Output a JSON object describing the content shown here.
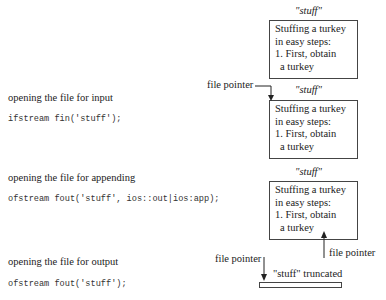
{
  "file_name": "\"stuff\"",
  "file_contents": [
    "Stuffing a turkey",
    "in easy steps:",
    "1. First, obtain",
    "a turkey"
  ],
  "pointer_label": "file pointer",
  "truncated_label": "\"stuff\" truncated",
  "modes": [
    {
      "label": "opening the file for input",
      "code": "ifstream fin('stuff');"
    },
    {
      "label": "opening the file for appending",
      "code": "ofstream fout('stuff', ios::out|ios:app);"
    },
    {
      "label": "opening the file for output",
      "code": "ofstream fout('stuff');"
    }
  ]
}
